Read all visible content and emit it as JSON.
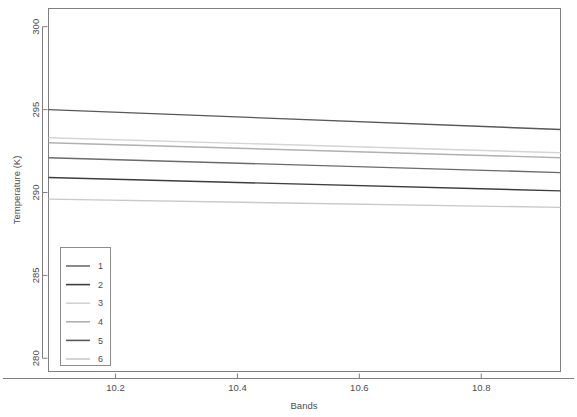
{
  "chart_data": {
    "type": "line",
    "title": "",
    "xlabel": "Bands",
    "ylabel": "Temperature (K)",
    "xlim": [
      10.09,
      10.93
    ],
    "ylim": [
      279.2,
      301.1
    ],
    "xticks": [
      10.2,
      10.4,
      10.6,
      10.8
    ],
    "xtick_labels": [
      "10.2",
      "10.4",
      "10.6",
      "10.8"
    ],
    "yticks": [
      280,
      285,
      290,
      295,
      300
    ],
    "ytick_labels": [
      "280",
      "285",
      "290",
      "295",
      "300"
    ],
    "grid": false,
    "legend_position": "bottom-left",
    "legend_title": "",
    "x": [
      10.09,
      10.93
    ],
    "series": [
      {
        "name": "1",
        "color": "#6b6b6b",
        "values": [
          292.1,
          291.2
        ]
      },
      {
        "name": "2",
        "color": "#3d3d3d",
        "values": [
          290.9,
          290.1
        ]
      },
      {
        "name": "3",
        "color": "#d4d4d4",
        "values": [
          293.3,
          292.4
        ]
      },
      {
        "name": "4",
        "color": "#b0b0b0",
        "values": [
          293.0,
          292.1
        ]
      },
      {
        "name": "5",
        "color": "#585858",
        "values": [
          295.0,
          293.8
        ]
      },
      {
        "name": "6",
        "color": "#c9c9c9",
        "values": [
          289.6,
          289.1
        ]
      }
    ]
  },
  "legend": {
    "entries": [
      {
        "label": "1"
      },
      {
        "label": "2"
      },
      {
        "label": "3"
      },
      {
        "label": "4"
      },
      {
        "label": "5"
      },
      {
        "label": "6"
      }
    ]
  },
  "colors": {
    "panel_border": "#7f7f7f",
    "axis": "#7f7f7f",
    "text": "#4d4d4d",
    "background": "#ffffff",
    "legend_border": "#8c8c8c"
  }
}
